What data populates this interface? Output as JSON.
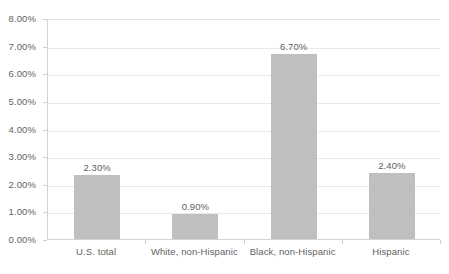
{
  "chart_data": {
    "type": "bar",
    "title": "",
    "subtitle": "",
    "xlabel": "",
    "ylabel": "",
    "categories": [
      "U.S. total",
      "White, non-Hispanic",
      "Black, non-Hispanic",
      "Hispanic"
    ],
    "values": [
      2.3,
      0.9,
      6.7,
      2.4
    ],
    "data_labels": [
      "2.30%",
      "0.90%",
      "6.70%",
      "2.40%"
    ],
    "ylim": [
      0,
      8
    ],
    "ytick_values": [
      0,
      1,
      2,
      3,
      4,
      5,
      6,
      7,
      8
    ],
    "ytick_labels": [
      "0.00%",
      "1.00%",
      "2.00%",
      "3.00%",
      "4.00%",
      "5.00%",
      "6.00%",
      "7.00%",
      "8.00%"
    ],
    "grid": true,
    "grid_axis": "y",
    "legend": false,
    "legend_position": "none",
    "bar_color": "#bfbfbf",
    "gridline_color": "#e8e8e8",
    "axis_color": "#d4d4d4",
    "text_color": "#636363",
    "background_color": "#ffffff"
  }
}
